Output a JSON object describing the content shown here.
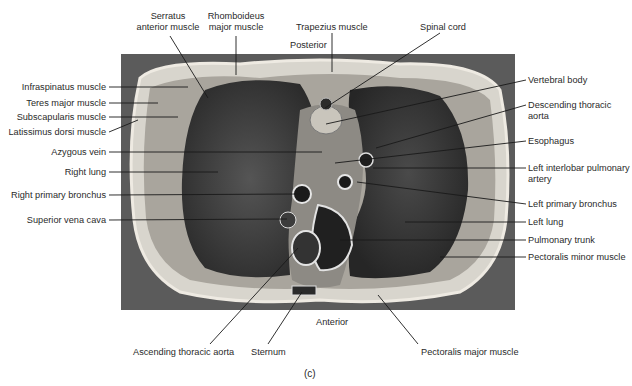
{
  "figure": {
    "panel_label": "(c)",
    "orientation": {
      "top": "Posterior",
      "bottom": "Anterior"
    },
    "image_colors": {
      "background": "#ffffff",
      "specimen_bg": "#5a5a5a",
      "tissue_light": "#d9d6cf",
      "lung_dark": "#2e2e2e"
    }
  },
  "labels": {
    "top": [
      {
        "id": "serratus",
        "text": "Serratus\nanterior muscle",
        "x": 168,
        "y": 11,
        "anchor": [
          208,
          98
        ]
      },
      {
        "id": "rhomboideus",
        "text": "Rhomboideus\nmajor muscle",
        "x": 236,
        "y": 11,
        "anchor": [
          236,
          75
        ]
      },
      {
        "id": "trapezius",
        "text": "Trapezius muscle",
        "x": 296,
        "y": 22,
        "anchor": [
          332,
          72
        ]
      },
      {
        "id": "spinal_cord",
        "text": "Spinal cord",
        "x": 420,
        "y": 22,
        "anchor": [
          325,
          108
        ]
      }
    ],
    "left": [
      {
        "id": "infraspinatus",
        "text": "Infraspinatus muscle",
        "y": 87,
        "anchor": [
          188,
          87
        ]
      },
      {
        "id": "teres_major",
        "text": "Teres major muscle",
        "y": 103,
        "anchor": [
          158,
          103
        ]
      },
      {
        "id": "subscapularis",
        "text": "Subscapularis muscle",
        "y": 117,
        "anchor": [
          178,
          117
        ]
      },
      {
        "id": "latissimus",
        "text": "Latissimus dorsi muscle",
        "y": 132,
        "anchor": [
          138,
          120
        ]
      },
      {
        "id": "azygous",
        "text": "Azygous vein",
        "y": 152,
        "anchor": [
          322,
          152
        ]
      },
      {
        "id": "right_lung",
        "text": "Right lung",
        "y": 172,
        "anchor": [
          218,
          172
        ]
      },
      {
        "id": "right_bronchus",
        "text": "Right primary bronchus",
        "y": 195,
        "anchor": [
          300,
          194
        ]
      },
      {
        "id": "svc",
        "text": "Superior vena cava",
        "y": 220,
        "anchor": [
          287,
          219
        ]
      }
    ],
    "right": [
      {
        "id": "vertebral_body",
        "text": "Vertebral body",
        "y": 80,
        "anchor": [
          326,
          124
        ]
      },
      {
        "id": "desc_aorta",
        "text": "Descending thoracic\naorta",
        "y": 105,
        "anchor": [
          376,
          148
        ]
      },
      {
        "id": "esophagus",
        "text": "Esophagus",
        "y": 141,
        "anchor": [
          335,
          163
        ]
      },
      {
        "id": "left_interlobar",
        "text": "Left interlobar pulmonary\nartery",
        "y": 168,
        "anchor": [
          373,
          168
        ]
      },
      {
        "id": "left_bronchus",
        "text": "Left primary bronchus",
        "y": 204,
        "anchor": [
          357,
          182
        ]
      },
      {
        "id": "left_lung",
        "text": "Left lung",
        "y": 222,
        "anchor": [
          405,
          222
        ]
      },
      {
        "id": "pulm_trunk",
        "text": "Pulmonary trunk",
        "y": 240,
        "anchor": [
          340,
          240
        ]
      },
      {
        "id": "pec_minor",
        "text": "Pectoralis minor muscle",
        "y": 257,
        "anchor": [
          440,
          257
        ]
      }
    ],
    "bottom": [
      {
        "id": "asc_aorta",
        "text": "Ascending thoracic aorta",
        "x": 133,
        "y": 322,
        "anchor": [
          298,
          248
        ]
      },
      {
        "id": "sternum",
        "text": "Sternum",
        "x": 251,
        "y": 322,
        "anchor": [
          302,
          292
        ]
      },
      {
        "id": "pec_major",
        "text": "Pectoralis major muscle",
        "x": 421,
        "y": 322,
        "anchor": [
          378,
          295
        ]
      }
    ]
  }
}
